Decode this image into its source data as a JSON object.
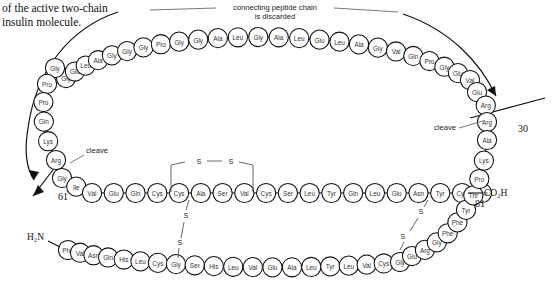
{
  "caption": {
    "line1": "of the active two-chain",
    "line2": "insulin molecule."
  },
  "annotations": {
    "connecting_chain_line1": "connecting peptide chain",
    "connecting_chain_line2": "is discarded",
    "cleave_left": "cleave",
    "cleave_right": "cleave",
    "num_61": "61",
    "num_30": "30",
    "num_81": "81",
    "n_terminus": "H₂N",
    "c_terminus": "CO₂H",
    "sulfur": "S"
  },
  "chains": {
    "connecting_peptide_top": {
      "name": "connecting peptide chain",
      "residues": [
        "Gly",
        "Glu",
        "Leu",
        "Ala",
        "Gly",
        "Gly",
        "Gly",
        "Pro",
        "Gly",
        "Gly",
        "Ala",
        "Leu",
        "Gly",
        "Ala",
        "Leu",
        "Glu",
        "Leu",
        "Ala",
        "Gly",
        "Val",
        "Gln",
        "Pro",
        "Gly",
        "Glu",
        "Val"
      ]
    },
    "connecting_peptide_left": {
      "name": "connecting peptide left arm",
      "residues": [
        "Gly",
        "Pro",
        "Pro",
        "Gln",
        "Lys",
        "Arg"
      ]
    },
    "connecting_peptide_right": {
      "name": "connecting peptide right arm",
      "residues": [
        "Glu",
        "Arg",
        "Arg"
      ]
    },
    "a_chain": {
      "name": "A chain",
      "residues": [
        "Gly",
        "Ile",
        "Val",
        "Glu",
        "Gln",
        "Cys",
        "Cys",
        "Ala",
        "Ser",
        "Val",
        "Cys",
        "Ser",
        "Leu",
        "Tyr",
        "Gln",
        "Leu",
        "Glu",
        "Asn",
        "Tyr",
        "Cys",
        "Asn"
      ]
    },
    "b_chain": {
      "name": "B chain",
      "residues": [
        "Phe",
        "Val",
        "Asn",
        "Gln",
        "His",
        "Leu",
        "Cys",
        "Gly",
        "Ser",
        "His",
        "Leu",
        "Val",
        "Glu",
        "Ala",
        "Leu",
        "Tyr",
        "Leu",
        "Val",
        "Cys",
        "Gly",
        "Glu",
        "Arg",
        "Gly",
        "Phe",
        "Phe",
        "Tyr",
        "Thr",
        "Pro",
        "Lys",
        "Ala"
      ]
    }
  },
  "disulfides": [
    {
      "name": "intrachain-A6-A11",
      "label": "S—S"
    },
    {
      "name": "interchain-left",
      "label": "S—S"
    },
    {
      "name": "interchain-right",
      "label": "S—S"
    }
  ]
}
